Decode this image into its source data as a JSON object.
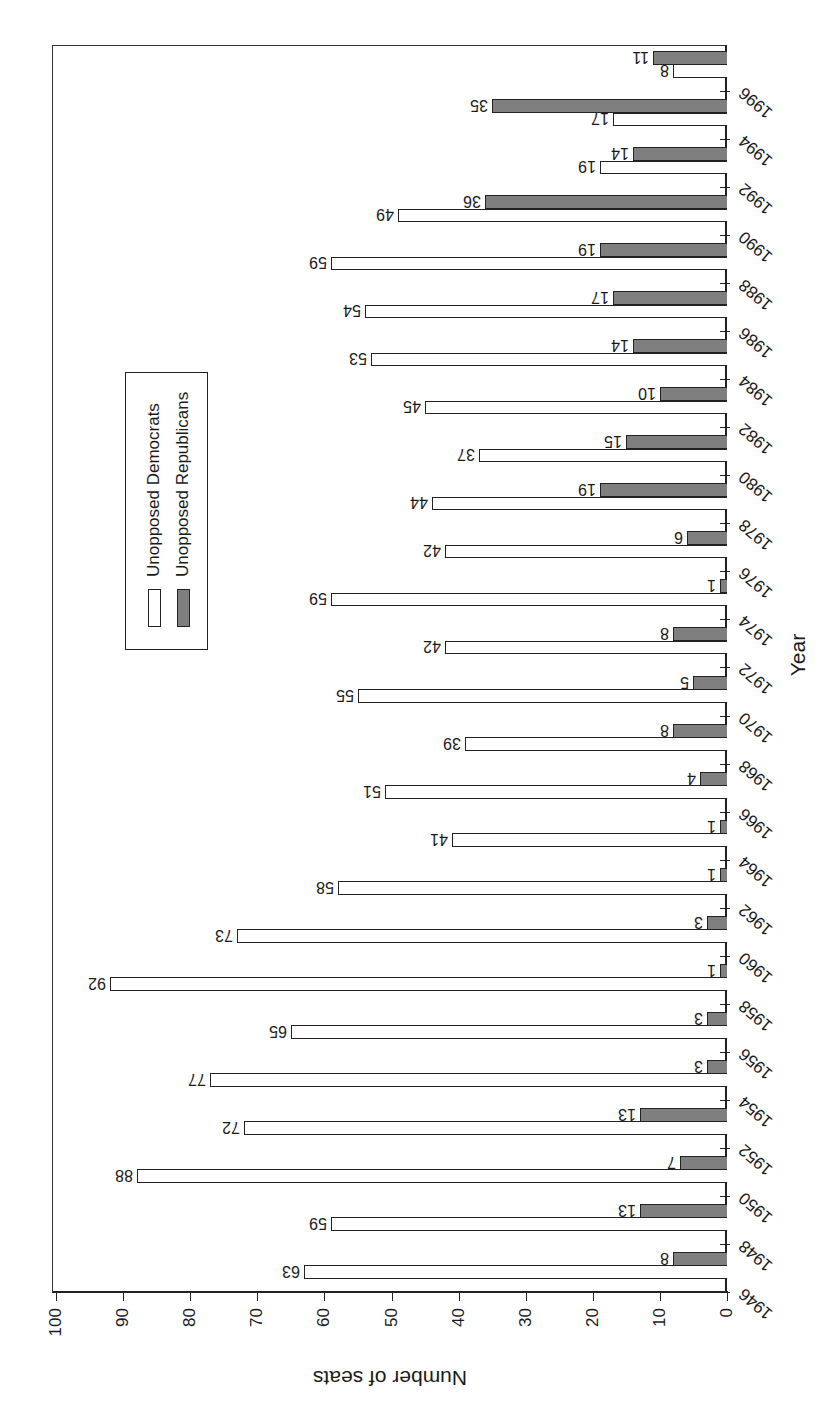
{
  "chart_data": {
    "type": "bar",
    "orientation_note": "figure rotated 90 degrees counter-clockwise on page",
    "title": "",
    "xlabel": "Year",
    "ylabel": "Number of seats",
    "ylim": [
      0,
      100
    ],
    "yticks": [
      0,
      10,
      20,
      30,
      40,
      50,
      60,
      70,
      80,
      90,
      100
    ],
    "categories": [
      "1946",
      "1948",
      "1950",
      "1952",
      "1954",
      "1956",
      "1958",
      "1960",
      "1962",
      "1964",
      "1966",
      "1968",
      "1970",
      "1972",
      "1974",
      "1976",
      "1978",
      "1980",
      "1982",
      "1984",
      "1986",
      "1988",
      "1990",
      "1992",
      "1994",
      "1996"
    ],
    "series": [
      {
        "name": "Unopposed Democrats",
        "color": "#ffffff",
        "values": [
          63,
          59,
          88,
          72,
          77,
          65,
          92,
          73,
          58,
          41,
          51,
          39,
          55,
          42,
          59,
          42,
          44,
          37,
          45,
          53,
          54,
          59,
          49,
          19,
          17,
          8
        ]
      },
      {
        "name": "Unopposed Republicans",
        "color": "#7f7f7f",
        "values": [
          8,
          13,
          7,
          13,
          3,
          3,
          1,
          3,
          1,
          1,
          4,
          8,
          5,
          8,
          1,
          6,
          19,
          15,
          10,
          14,
          17,
          19,
          36,
          14,
          35,
          11
        ]
      }
    ],
    "legend_position": "upper center",
    "grid": false,
    "data_labels": true
  },
  "legend": {
    "items": [
      {
        "label": "Unopposed Democrats"
      },
      {
        "label": "Unopposed Republicans"
      }
    ]
  },
  "axes": {
    "xlabel": "Year",
    "ylabel": "Number of seats"
  }
}
